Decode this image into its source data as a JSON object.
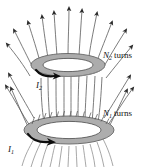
{
  "figure": {
    "background_color": "#ffffff",
    "labels": {
      "upper_turns_symbol": "N",
      "upper_turns_subscript": "2",
      "upper_turns_word": "turns",
      "lower_turns_symbol": "N",
      "lower_turns_subscript": "1",
      "lower_turns_word": "turns",
      "upper_current_symbol": "I",
      "upper_current_subscript": "2",
      "lower_current_symbol": "I",
      "lower_current_subscript": "1"
    },
    "colors": {
      "coil_fill": "#b5b5b5",
      "coil_shade": "#9a9a9a",
      "coil_outline": "#4a4a4a",
      "field_line": "#5b5b5b",
      "field_line_faint": "#8a8a8a",
      "current_arrow": "#0d0d0d",
      "text": "#111111"
    },
    "elements": {
      "upper_coil_name": "upper-coil",
      "lower_coil_name": "lower-coil",
      "field_lines_name": "magnetic-field-lines"
    }
  }
}
